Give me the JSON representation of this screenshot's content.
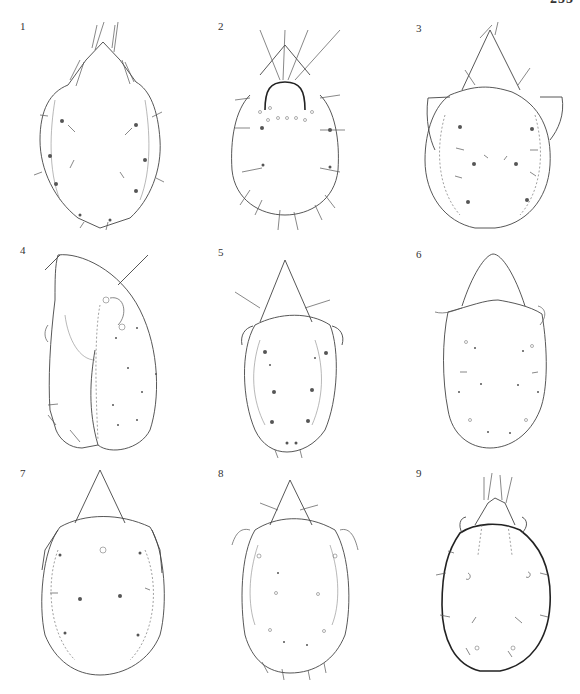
{
  "page": {
    "number": "255",
    "layout": "3x3 figure plate"
  },
  "figures": [
    {
      "label": "1",
      "view": "dorsal",
      "shape": "pear-shaped"
    },
    {
      "label": "2",
      "view": "dorsal",
      "shape": "oval with setae"
    },
    {
      "label": "3",
      "view": "dorsal",
      "shape": "round with pteromorphs"
    },
    {
      "label": "4",
      "view": "lateral",
      "shape": "oblong"
    },
    {
      "label": "5",
      "view": "dorsal",
      "shape": "elongate oval"
    },
    {
      "label": "6",
      "view": "dorsal",
      "shape": "rectangular oval"
    },
    {
      "label": "7",
      "view": "dorsal",
      "shape": "round oval"
    },
    {
      "label": "8",
      "view": "dorsal",
      "shape": "oval"
    },
    {
      "label": "9",
      "view": "dorsal",
      "shape": "oval bold outline"
    }
  ]
}
